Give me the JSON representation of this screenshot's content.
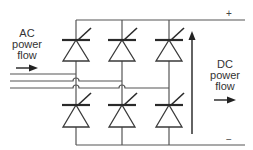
{
  "diagram": {
    "ac_label": {
      "line1": "AC",
      "line2": "power",
      "line3": "flow"
    },
    "dc_label": {
      "line1": "DC",
      "line2": "power",
      "line3": "flow"
    },
    "dc_positive": "+",
    "dc_negative": "−",
    "components": {
      "top_thyristors": 3,
      "bottom_thyristors": 3,
      "ac_phase_lines": 3
    },
    "colors": {
      "line": "#555555",
      "device": "#2a2a2a",
      "text": "#333333"
    }
  }
}
